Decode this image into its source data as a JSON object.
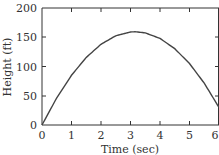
{
  "chart_data": {
    "type": "line",
    "title": "",
    "xlabel": "Time (sec)",
    "ylabel": "Height (ft)",
    "xlim": [
      0,
      6
    ],
    "ylim": [
      0,
      200
    ],
    "x_ticks": [
      "0",
      "1",
      "2",
      "3",
      "4",
      "5",
      "6"
    ],
    "y_ticks": [
      "0",
      "50",
      "100",
      "150",
      "200"
    ],
    "grid": false,
    "legend": null,
    "series": [
      {
        "name": "height",
        "x": [
          0,
          0.5,
          1,
          1.5,
          2,
          2.5,
          3,
          3.15,
          3.5,
          4,
          4.5,
          5,
          5.5,
          6
        ],
        "values": [
          0,
          46.5,
          85,
          115.5,
          138,
          152.5,
          159,
          159.4,
          157.5,
          148,
          130.5,
          105,
          71.5,
          30
        ]
      }
    ],
    "colors": {
      "line": "#444444",
      "axis": "#333333"
    }
  },
  "labels": {
    "x_axis": "Time (sec)",
    "y_axis": "Height (ft)",
    "x_ticks": [
      "0",
      "1",
      "2",
      "3",
      "4",
      "5",
      "6"
    ],
    "y_ticks": [
      "0",
      "50",
      "100",
      "150",
      "200"
    ]
  }
}
